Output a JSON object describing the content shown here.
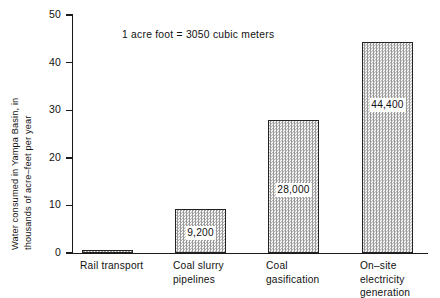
{
  "chart_data": {
    "type": "bar",
    "title": "",
    "subtitle": "",
    "xlabel": "",
    "ylabel": "Water consumed in Yampa Basin, in thousands of acre–feet per year",
    "ylabel_line1": "Water consumed in Yampa Basin, in",
    "ylabel_line2": "thousands of acre–feet per year",
    "categories": [
      "Rail transport",
      "Coal slurry\npipelines",
      "Coal\ngasification",
      "On–site\nelectricity\ngeneration"
    ],
    "values": [
      0.5,
      9.2,
      28.0,
      44.4
    ],
    "value_labels": [
      "",
      "9,200",
      "28,000",
      "44,400"
    ],
    "ylim": [
      0,
      50
    ],
    "yticks": [
      0,
      10,
      20,
      30,
      40,
      50
    ],
    "ytick_labels": [
      "0",
      "10",
      "20",
      "30",
      "40",
      "50"
    ],
    "annotation": "1 acre foot = 3050 cubic meters",
    "grid": false,
    "legend": "none",
    "units_note": "values in acre-feet per year",
    "bar_fill_color": "#9a9a9a",
    "bar_edge_color": "#232323",
    "axis_color": "#1a1a1a",
    "background_color": "#ffffff"
  }
}
